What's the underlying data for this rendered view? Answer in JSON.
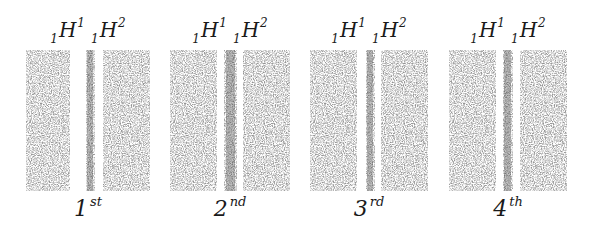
{
  "figure": {
    "colors": {
      "background": "#ffffff",
      "stipple": "#6e6e6e",
      "line_dark": "#4a4a4a",
      "text": "#1a1a1a"
    },
    "isotope_label": {
      "first": {
        "sub": "1",
        "symbol": "H",
        "sup": "1"
      },
      "second": {
        "sub": "1",
        "symbol": "H",
        "sup": "2"
      }
    },
    "panels": [
      {
        "order_number": "1",
        "order_suffix": "st",
        "x": 26,
        "width": 124,
        "bands": {
          "white1": [
            44,
            59
          ],
          "dark": [
            60,
            68
          ],
          "white2": [
            69,
            77
          ]
        }
      },
      {
        "order_number": "2",
        "order_suffix": "nd",
        "x": 170,
        "width": 120,
        "bands": {
          "white1": [
            47,
            54
          ],
          "dark": [
            54,
            67
          ],
          "white2": [
            67,
            73
          ]
        }
      },
      {
        "order_number": "3",
        "order_suffix": "rd",
        "x": 310,
        "width": 118,
        "bands": {
          "white1": [
            47,
            55
          ],
          "dark": [
            56,
            65
          ],
          "white2": [
            65,
            71
          ]
        }
      },
      {
        "order_number": "4",
        "order_suffix": "th",
        "x": 449,
        "width": 118,
        "bands": {
          "white1": [
            47,
            53
          ],
          "dark": [
            54,
            64
          ],
          "white2": [
            64,
            71
          ]
        }
      }
    ]
  }
}
